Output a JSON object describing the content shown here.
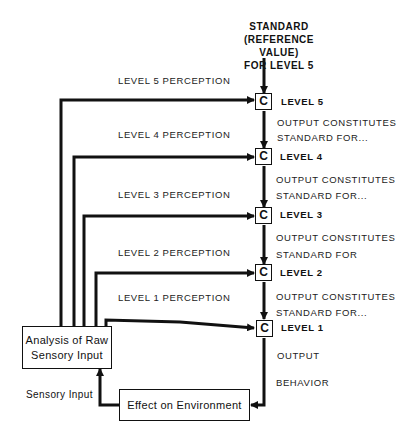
{
  "standard": {
    "line1": "STANDARD",
    "line2": "(REFERENCE VALUE)",
    "line3": "FOR LEVEL 5"
  },
  "levels": [
    {
      "id": 5,
      "comparator": "C",
      "label": "LEVEL 5",
      "perception": "LEVEL 5 PERCEPTION",
      "output_line1": "OUTPUT CONSTITUTES",
      "output_line2": "STANDARD FOR..."
    },
    {
      "id": 4,
      "comparator": "C",
      "label": "LEVEL 4",
      "perception": "LEVEL 4 PERCEPTION",
      "output_line1": "OUTPUT CONSTITUTES",
      "output_line2": "STANDARD FOR..."
    },
    {
      "id": 3,
      "comparator": "C",
      "label": "LEVEL 3",
      "perception": "LEVEL 3 PERCEPTION",
      "output_line1": "OUTPUT CONSTITUTES",
      "output_line2": "STANDARD FOR"
    },
    {
      "id": 2,
      "comparator": "C",
      "label": "LEVEL 2",
      "perception": "LEVEL 2 PERCEPTION",
      "output_line1": "OUTPUT CONSTITUTES",
      "output_line2": "STANDARD FOR..."
    },
    {
      "id": 1,
      "comparator": "C",
      "label": "LEVEL 1",
      "perception": "LEVEL 1 PERCEPTION",
      "output_line1": "OUTPUT",
      "output_line2": "BEHAVIOR"
    }
  ],
  "analysis_box": {
    "line1": "Analysis of Raw",
    "line2": "Sensory Input"
  },
  "environment_box": {
    "label": "Effect on Environment"
  },
  "sensory_input_label": "Sensory Input",
  "colors": {
    "line": "#111111",
    "background": "#ffffff"
  }
}
